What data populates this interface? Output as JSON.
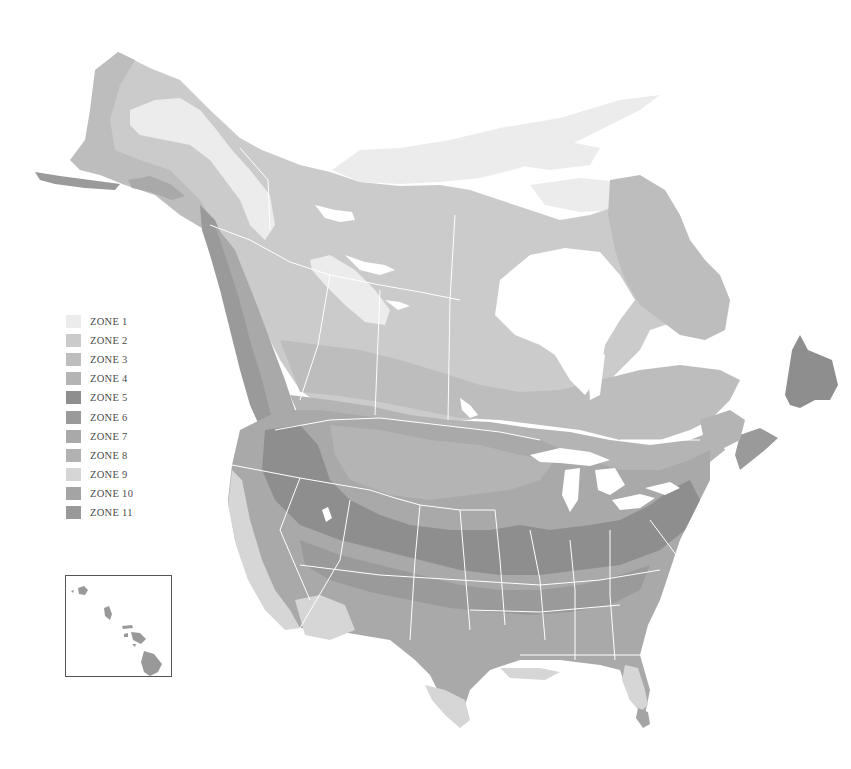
{
  "map": {
    "title": "",
    "type": "Plant hardiness zone map of North America",
    "background": "#ffffff",
    "border_color": "#ffffff",
    "water_color": "#ffffff"
  },
  "legend": {
    "items": [
      {
        "label": "ZONE 1",
        "color": "#ececec"
      },
      {
        "label": "ZONE 2",
        "color": "#cbcbcb"
      },
      {
        "label": "ZONE 3",
        "color": "#bdbdbd"
      },
      {
        "label": "ZONE 4",
        "color": "#b4b4b4"
      },
      {
        "label": "ZONE 5",
        "color": "#8e8e8e"
      },
      {
        "label": "ZONE 6",
        "color": "#9a9a9a"
      },
      {
        "label": "ZONE 7",
        "color": "#a9a9a9"
      },
      {
        "label": "ZONE 8",
        "color": "#b2b2b2"
      },
      {
        "label": "ZONE 9",
        "color": "#d6d6d6"
      },
      {
        "label": "ZONE 10",
        "color": "#a4a4a4"
      },
      {
        "label": "ZONE 11",
        "color": "#999999"
      }
    ]
  },
  "inset": {
    "name": "Hawaii",
    "border_color": "#555555"
  }
}
